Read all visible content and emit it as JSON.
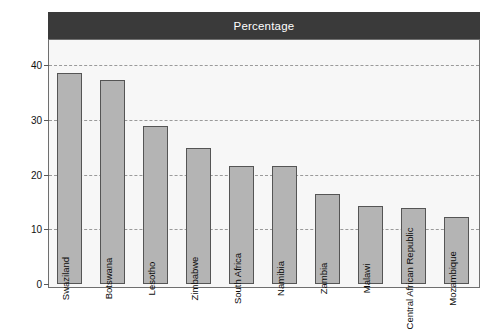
{
  "chart_data": {
    "type": "bar",
    "title": "Percentage",
    "xlabel": "",
    "ylabel": "",
    "ylim": [
      0,
      44
    ],
    "yticks": [
      0,
      10,
      20,
      30,
      40
    ],
    "ytick_labels": [
      "0",
      "10",
      "20",
      "30",
      "40"
    ],
    "grid": true,
    "legend": false,
    "orientation": "vertical",
    "categories": [
      "Swaziland",
      "Botswana",
      "Lesotho",
      "Zimbabwe",
      "South Africa",
      "Namibia",
      "Zambia",
      "Malawi",
      "Central African Republic",
      "Mozambique"
    ],
    "values": [
      38.5,
      37.2,
      28.9,
      24.9,
      21.5,
      21.5,
      16.5,
      14.2,
      13.9,
      12.2
    ],
    "bar_color": "#b4b4b4",
    "bar_edge_color": "#555555",
    "title_bar_color": "#3a3a3a",
    "title_text_color": "#ffffff",
    "plot_background": "#f7f7f7",
    "grid_color": "#9a9a9a",
    "axis_color": "#6f6f6f"
  }
}
